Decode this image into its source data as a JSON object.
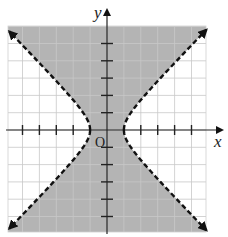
{
  "chart_data": {
    "type": "region-plot",
    "title": "",
    "inequality": "x^2 - y^2 < 1",
    "boundary": {
      "curve": "hyperbola",
      "equation": "x^2 - y^2 = 1",
      "style": "dashed",
      "vertices": [
        [
          -1,
          0
        ],
        [
          1,
          0
        ]
      ],
      "asymptotes": [
        "y = x",
        "y = -x"
      ]
    },
    "shaded_region": "between the two branches (contains the origin)",
    "xlabel": "x",
    "ylabel": "y",
    "origin_label": "O",
    "xlim": [
      -5.8,
      5.8
    ],
    "ylim": [
      -6,
      6
    ],
    "x_ticks": [
      -5,
      -4,
      -3,
      -2,
      2,
      3,
      4,
      5
    ],
    "y_ticks": [
      -5,
      -4,
      -3,
      -2,
      -1,
      1,
      2,
      3,
      4,
      5
    ],
    "grid": true,
    "colors": {
      "shade": "#b4b4b4",
      "grid": "#c8c8c8",
      "curve": "#111111"
    }
  },
  "labels": {
    "x": "x",
    "y": "y",
    "origin": "O"
  }
}
